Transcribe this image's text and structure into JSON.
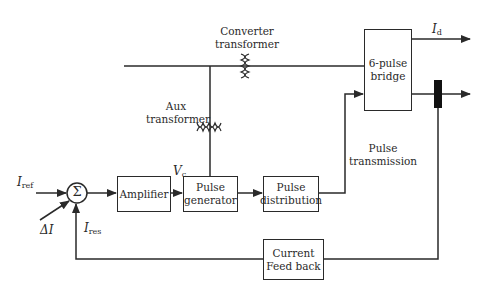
{
  "diagram": {
    "blocks": {
      "amplifier": "Amplifier",
      "pulse_generator_l1": "Pulse",
      "pulse_generator_l2": "generator",
      "pulse_distribution_l1": "Pulse",
      "pulse_distribution_l2": "distribution",
      "bridge_l1": "6-pulse",
      "bridge_l2": "bridge",
      "feedback_l1": "Current",
      "feedback_l2": "Feed back",
      "summer_symbol": "Σ"
    },
    "labels": {
      "converter_transformer_l1": "Converter",
      "converter_transformer_l2": "transformer",
      "aux_transformer_l1": "Aux",
      "aux_transformer_l2": "transformer",
      "pulse_transmission_l1": "Pulse",
      "pulse_transmission_l2": "transmission"
    },
    "signals": {
      "i_ref": {
        "base": "I",
        "sub": "ref"
      },
      "delta_i": {
        "base": "ΔI",
        "sub": ""
      },
      "i_res": {
        "base": "I",
        "sub": "res"
      },
      "v_c": {
        "base": "V",
        "sub": "c"
      },
      "i_d": {
        "base": "I",
        "sub": "d"
      }
    },
    "colors": {
      "line": "#2a2a2a",
      "background": "#ffffff"
    }
  }
}
